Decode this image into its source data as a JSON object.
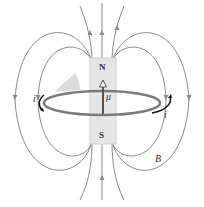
{
  "diagram": {
    "type": "magnetic dipole field of current loop",
    "magnet": {
      "north_label": "N",
      "south_label": "S"
    },
    "moment_label": "μ",
    "current_label_left": "i",
    "current_label_right": "i",
    "field_label": "B",
    "colors": {
      "field_lines": "#8a8a8a",
      "magnet": "#e6e6e6",
      "loop": "#7a7a7a",
      "arrow": "#555555"
    }
  }
}
